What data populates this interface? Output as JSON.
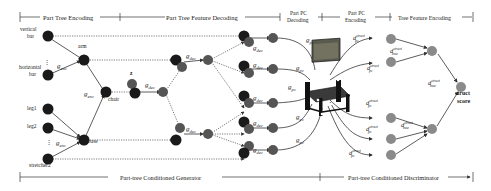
{
  "sections_top": [
    {
      "label": "Part Tree Encoding"
    },
    {
      "label": "Part Tree Feature Decoding"
    },
    {
      "label_line1": "Part PC",
      "label_line2": "Decoding"
    },
    {
      "label_line1": "Part PC",
      "label_line2": "Encoding"
    },
    {
      "label": "Tree Feature Encoding"
    }
  ],
  "sections_bottom": [
    {
      "label": "Part-tree Conditioned Generator"
    },
    {
      "label": "Part-tree Conditioned Discriminator"
    }
  ],
  "leaf_labels": {
    "vertical_bar_1": "vertical",
    "vertical_bar_2": "bar",
    "horizontal_bar_1": "horizontal",
    "horizontal_bar_2": "bar",
    "leg1": "leg1",
    "leg2": "leg2",
    "stretcher2": "stretcher2",
    "ellipsis": "⋮"
  },
  "internal_labels": {
    "arm": "arm",
    "chair": "chair",
    "base": "base",
    "z": "z"
  },
  "function_labels": {
    "g_enc": "g",
    "g_enc_sub": "enc",
    "g_dec": "g",
    "g_dec_sub": "dec",
    "g_pc": "g",
    "g_pc_sub": "pc",
    "d_struct": "d",
    "d_struct_sup": "struct",
    "d_pc_sub": "pc",
    "d_tree_sub": "tree"
  },
  "output": {
    "line1": "struct",
    "line2": "score"
  },
  "colors": {
    "black_node": "#1a1a1a",
    "dark_gray_node": "#4a4a4a",
    "gray_node": "#8a8a8a",
    "edge": "#333333",
    "text": "#222222"
  }
}
